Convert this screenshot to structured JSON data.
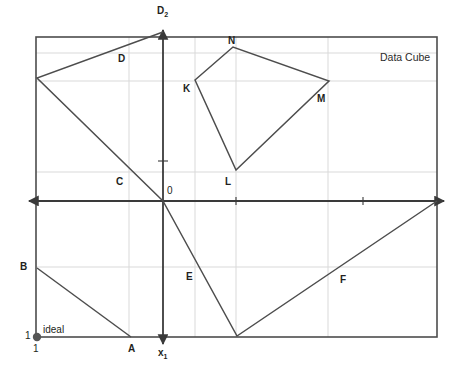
{
  "figure": {
    "title": "Data Cube",
    "axes": {
      "vertical_label": "D",
      "vertical_label_sub": "2",
      "horizontal_label": "x",
      "horizontal_label_sub": "1",
      "origin_label": "0"
    },
    "annotations": {
      "ideal_label": "ideal",
      "ideal_tick_y": "1",
      "ideal_tick_x": "1"
    },
    "point_labels": [
      {
        "id": "A",
        "text": "A",
        "x": 128,
        "y": 344
      },
      {
        "id": "B",
        "text": "B",
        "x": 20,
        "y": 262
      },
      {
        "id": "C",
        "text": "C",
        "x": 116,
        "y": 177
      },
      {
        "id": "D",
        "text": "D",
        "x": 118,
        "y": 54
      },
      {
        "id": "E",
        "text": "E",
        "x": 186,
        "y": 272
      },
      {
        "id": "F",
        "text": "F",
        "x": 340,
        "y": 275
      },
      {
        "id": "K",
        "text": "K",
        "x": 183,
        "y": 84
      },
      {
        "id": "L",
        "text": "L",
        "x": 225,
        "y": 177
      },
      {
        "id": "M",
        "text": "M",
        "x": 317,
        "y": 94
      },
      {
        "id": "N",
        "text": "N",
        "x": 228,
        "y": 36
      }
    ]
  },
  "chart_data": {
    "type": "diagram",
    "title": "Data Cube",
    "xlabel": "x1",
    "ylabel": "D2",
    "grid": true,
    "frame": {
      "left": 36,
      "top": 37,
      "right": 437,
      "bottom": 337
    },
    "origin": {
      "x": 163,
      "y": 201
    },
    "gridlines": {
      "vertical_x": [
        129,
        195,
        236,
        328
      ],
      "horizontal_y": [
        53,
        81,
        172,
        267
      ]
    },
    "axis_ticks": {
      "horizontal_x": [
        236,
        363
      ],
      "vertical_y": [
        161
      ]
    },
    "ideal_point": {
      "x": 37,
      "y": 337
    },
    "polylines": [
      {
        "name": "upper-left-wedge",
        "points": [
          [
            163,
            32
          ],
          [
            37,
            78
          ],
          [
            163,
            201
          ]
        ],
        "labels": [
          "D",
          "C"
        ]
      },
      {
        "name": "lower-left-wedge",
        "points": [
          [
            37,
            268
          ],
          [
            131,
            337
          ]
        ],
        "labels": [
          "B",
          "A"
        ]
      },
      {
        "name": "lower-right-vee",
        "points": [
          [
            163,
            201
          ],
          [
            237,
            336
          ],
          [
            437,
            201
          ]
        ],
        "labels": [
          "E",
          "F"
        ]
      },
      {
        "name": "quadrilateral-KLMN",
        "points": [
          [
            195,
            80
          ],
          [
            233,
            47
          ],
          [
            329,
            81
          ],
          [
            236,
            170
          ],
          [
            195,
            80
          ]
        ],
        "labels": [
          "K",
          "N",
          "M",
          "L"
        ],
        "closed": true
      }
    ],
    "colors": {
      "line": "#4d4d4d",
      "axis": "#3a3a3a",
      "grid": "#d9d9d9",
      "frame": "#4d4d4d",
      "text": "#231f20"
    }
  }
}
